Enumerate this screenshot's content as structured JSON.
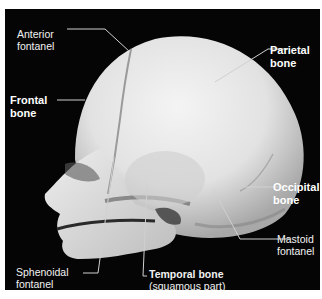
{
  "figure": {
    "background_color": "#050505",
    "bone_color": "#e8e8e8",
    "leader_line_color": "#d0d0d0"
  },
  "labels": {
    "anterior_fontanel": {
      "line1": "Anterior",
      "line2": "fontanel",
      "bold": false
    },
    "parietal_bone": {
      "line1": "Parietal",
      "line2": "bone",
      "bold": true
    },
    "frontal_bone": {
      "line1": "Frontal",
      "line2": "bone",
      "bold": true
    },
    "occipital_bone": {
      "line1": "Occipital",
      "line2": "bone",
      "bold": true
    },
    "mastoid_fontanel": {
      "line1": "Mastoid",
      "line2": "fontanel",
      "bold": false
    },
    "sphenoidal_fontanel": {
      "line1": "Sphenoidal",
      "line2": "fontanel",
      "bold": false
    },
    "temporal_bone": {
      "line1": "Temporal bone",
      "line2": "(squamous part)",
      "bold_line1": true
    }
  }
}
